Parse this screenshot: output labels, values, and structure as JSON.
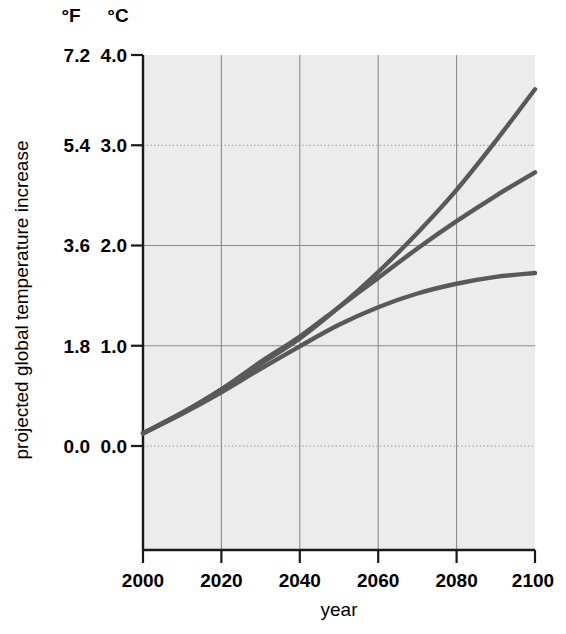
{
  "chart_data": {
    "type": "line",
    "title": "",
    "xlabel": "year",
    "ylabel": "projected global temperature increase",
    "x": [
      2000,
      2010,
      2020,
      2030,
      2040,
      2050,
      2060,
      2070,
      2080,
      2090,
      2100
    ],
    "xlim": [
      2000,
      2100
    ],
    "xticks": [
      2000,
      2020,
      2040,
      2060,
      2080,
      2100
    ],
    "xticklabels": [
      "2000",
      "2020",
      "2040",
      "2060",
      "2080",
      "2100"
    ],
    "ylim": [
      0.0,
      4.0
    ],
    "yticks": [
      0.0,
      1.0,
      2.0,
      3.0,
      4.0
    ],
    "y_axis_primary_unit": "°C",
    "y_axis_secondary_unit": "°F",
    "yticklabels_celsius": [
      "0.0",
      "1.0",
      "2.0",
      "3.0",
      "4.0"
    ],
    "yticklabels_fahrenheit": [
      "0.0",
      "1.8",
      "3.6",
      "5.4",
      "7.2"
    ],
    "grid": true,
    "legend": "none",
    "series": [
      {
        "name": "high-emissions-scenario",
        "color": "#595959",
        "values": [
          0.13,
          0.34,
          0.58,
          0.84,
          1.1,
          1.42,
          1.78,
          2.18,
          2.62,
          3.12,
          3.65
        ]
      },
      {
        "name": "mid-emissions-scenario",
        "color": "#595959",
        "values": [
          0.13,
          0.34,
          0.58,
          0.86,
          1.12,
          1.42,
          1.72,
          2.02,
          2.3,
          2.56,
          2.8
        ]
      },
      {
        "name": "low-emissions-scenario",
        "color": "#595959",
        "values": [
          0.13,
          0.33,
          0.55,
          0.79,
          1.02,
          1.24,
          1.42,
          1.56,
          1.66,
          1.73,
          1.77
        ]
      }
    ]
  },
  "axes": {
    "unit_header_fahrenheit": "°F",
    "unit_header_celsius": "°C",
    "y_title": "projected global temperature increase",
    "x_title": "year",
    "f_labels": [
      "7.2",
      "5.4",
      "3.6",
      "1.8",
      "0.0"
    ],
    "c_labels": [
      "4.0",
      "3.0",
      "2.0",
      "1.0",
      "0.0"
    ],
    "x_labels": [
      "2000",
      "2020",
      "2040",
      "2060",
      "2080",
      "2100"
    ]
  },
  "colors": {
    "curve": "#595959",
    "plot_background": "#ececec",
    "grid": "#8c8c8c",
    "axis": "#1a1a1a",
    "page_background": "#ffffff"
  }
}
